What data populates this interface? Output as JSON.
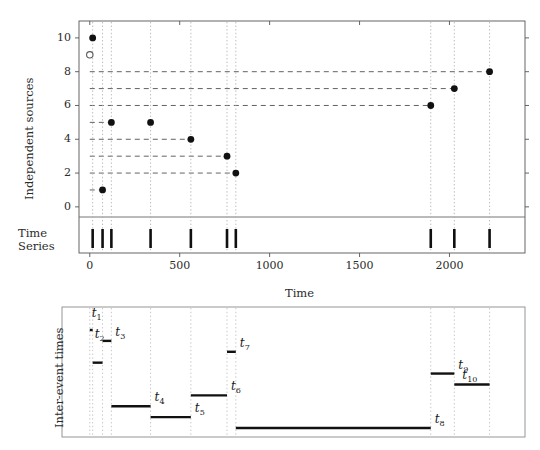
{
  "figure": {
    "kind": "event-sequence-and-inter-event-time-diagram"
  },
  "top_panel": {
    "ylabel": "Independent sources",
    "xlabel": "Time",
    "y_ticks": [
      0,
      2,
      4,
      6,
      8,
      10
    ],
    "x_ticks": [
      0,
      500,
      1000,
      1500,
      2000
    ],
    "xlim": [
      -60,
      2420
    ],
    "ylim": [
      -0.6,
      11.0
    ],
    "strip_label_line1": "Time",
    "strip_label_line2": "Series",
    "open_marker": {
      "x": 0,
      "y": 9
    }
  },
  "bottom_panel": {
    "ylabel": "Inter-event times"
  },
  "chart_data": {
    "type": "scatter",
    "title": "",
    "xlabel": "Time",
    "ylabel": "Independent sources",
    "xlim": [
      -60,
      2420
    ],
    "ylim": [
      -0.6,
      11.0
    ],
    "x_ticks": [
      0,
      500,
      1000,
      1500,
      2000
    ],
    "y_ticks": [
      0,
      2,
      4,
      6,
      8,
      10
    ],
    "grid": "dashed-horizontal-and-dotted-vertical",
    "legend": "none",
    "series": [
      {
        "name": "events",
        "points": [
          {
            "label": "e1",
            "time": 16,
            "source": 10,
            "marker": "filled"
          },
          {
            "label": "e2",
            "time": 71,
            "source": 1,
            "marker": "filled"
          },
          {
            "label": "e3",
            "time": 120,
            "source": 5,
            "marker": "filled"
          },
          {
            "label": "e4",
            "time": 338,
            "source": 5,
            "marker": "filled"
          },
          {
            "label": "e5",
            "time": 562,
            "source": 4,
            "marker": "filled"
          },
          {
            "label": "e6",
            "time": 763,
            "source": 3,
            "marker": "filled"
          },
          {
            "label": "e7",
            "time": 812,
            "source": 2,
            "marker": "filled"
          },
          {
            "label": "e8",
            "time": 1896,
            "source": 6,
            "marker": "filled"
          },
          {
            "label": "e9",
            "time": 2027,
            "source": 7,
            "marker": "filled"
          },
          {
            "label": "e10",
            "time": 2223,
            "source": 8,
            "marker": "filled"
          }
        ],
        "open_start_marker": {
          "time": 0,
          "source": 9
        }
      }
    ],
    "dashed_guides_y": [
      2,
      3,
      4,
      5,
      6,
      7,
      8
    ],
    "event_times": [
      16,
      71,
      120,
      338,
      562,
      763,
      812,
      1896,
      2027,
      2223
    ],
    "inter_event": {
      "type": "bar",
      "ylabel": "Inter-event times",
      "labels": [
        "t₁",
        "t₂",
        "t₃",
        "t₄",
        "t₅",
        "t₆",
        "t₇",
        "t₈",
        "t₉",
        "t₁₀"
      ],
      "label_base": "t",
      "label_subs": [
        "1",
        "2",
        "3",
        "4",
        "5",
        "6",
        "7",
        "8",
        "9",
        "10"
      ],
      "starts": [
        0,
        16,
        71,
        120,
        338,
        562,
        763,
        812,
        1896,
        2027
      ],
      "ends": [
        16,
        71,
        120,
        338,
        562,
        763,
        812,
        1896,
        2027,
        2223
      ],
      "durations": [
        16,
        55,
        49,
        218,
        224,
        201,
        49,
        1084,
        131,
        196
      ]
    }
  }
}
